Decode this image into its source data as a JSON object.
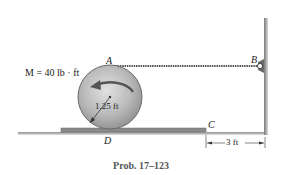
{
  "diagram": {
    "moment_label": "M = 40 lb · ft",
    "point_A": "A",
    "point_B": "B",
    "point_C": "C",
    "point_D": "D",
    "radius_label": "1.25 ft",
    "distance_label": "3 ft",
    "caption": "Prob. 17–123"
  },
  "colors": {
    "disk_fill": "#b9b9b9",
    "disk_edge": "#6a6a6a",
    "plank": "#8a8a8a",
    "cable": "#555555",
    "wall": "#9a9a9a",
    "text": "#222222",
    "caption": "#555555"
  }
}
